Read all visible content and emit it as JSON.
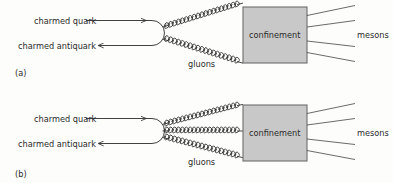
{
  "figure": {
    "background_color": "#fdfdfb",
    "line_color": "#2b2b2b",
    "box_fill_color": "#c8c8c8",
    "box_border_color": "#6e6e6e"
  },
  "panels": [
    {
      "id": "a",
      "panel_label": "(a)",
      "quark_label": "charmed quark",
      "quark_arrow": "right-arrow",
      "antiquark_label": "charmed antiquark",
      "antiquark_arrow": "left-arrow",
      "gluons_label": "gluons",
      "gluon_count": 2,
      "confinement_label": "confinement",
      "mesons_label": "mesons",
      "meson_count": 4
    },
    {
      "id": "b",
      "panel_label": "(b)",
      "quark_label": "charmed quark",
      "quark_arrow": "right-arrow",
      "antiquark_label": "charmed antiquark",
      "antiquark_arrow": "left-arrow",
      "gluons_label": "gluons",
      "gluon_count": 3,
      "confinement_label": "confinement",
      "mesons_label": "mesons",
      "meson_count": 4
    }
  ]
}
